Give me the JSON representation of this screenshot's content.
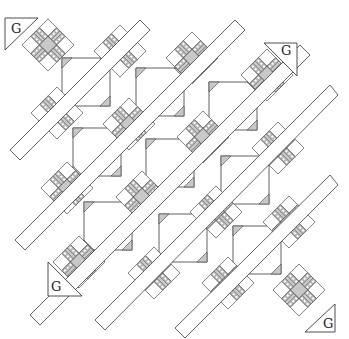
{
  "diagram": {
    "colors": {
      "line": "#3a3a3a",
      "gray": "#c8c8c8",
      "white": "#ffffff",
      "hatch": "#8a8a8a"
    },
    "star_size": 52,
    "snowball_size": 48,
    "stars": [
      [
        48,
        45
      ],
      [
        120,
        51
      ],
      [
        192,
        58
      ],
      [
        267,
        75
      ],
      [
        57,
        113
      ],
      [
        129,
        124
      ],
      [
        203,
        137
      ],
      [
        278,
        148
      ],
      [
        67,
        188
      ],
      [
        142,
        197
      ],
      [
        216,
        212
      ],
      [
        289,
        222
      ],
      [
        79,
        262
      ],
      [
        154,
        273
      ],
      [
        228,
        283
      ],
      [
        299,
        290
      ]
    ],
    "snowballs": [
      [
        86,
        82
      ],
      [
        160,
        92
      ],
      [
        233,
        106
      ],
      [
        97,
        152
      ],
      [
        170,
        163
      ],
      [
        245,
        180
      ],
      [
        108,
        226
      ],
      [
        183,
        238
      ],
      [
        257,
        250
      ]
    ],
    "sashing_strips": [
      [
        [
          10,
          150
        ],
        [
          140,
          20
        ],
        [
          150,
          30
        ],
        [
          20,
          160
        ]
      ],
      [
        [
          15,
          240
        ],
        [
          235,
          20
        ],
        [
          245,
          30
        ],
        [
          25,
          250
        ]
      ],
      [
        [
          30,
          315
        ],
        [
          300,
          45
        ],
        [
          310,
          55
        ],
        [
          40,
          325
        ]
      ],
      [
        [
          95,
          320
        ],
        [
          330,
          85
        ],
        [
          338,
          95
        ],
        [
          105,
          330
        ]
      ],
      [
        [
          175,
          328
        ],
        [
          330,
          175
        ],
        [
          338,
          185
        ],
        [
          185,
          338
        ]
      ]
    ],
    "corner_triangles": [
      {
        "label": "G",
        "points": [
          [
            5,
            18
          ],
          [
            38,
            18
          ],
          [
            5,
            50
          ]
        ],
        "text_pos": [
          11,
          33
        ]
      },
      {
        "label": "G",
        "points": [
          [
            264,
            43
          ],
          [
            297,
            43
          ],
          [
            297,
            76
          ]
        ],
        "text_pos": [
          281,
          55
        ]
      },
      {
        "label": "G",
        "points": [
          [
            48,
            262
          ],
          [
            48,
            296
          ],
          [
            82,
            296
          ]
        ],
        "text_pos": [
          51,
          291
        ]
      },
      {
        "label": "G",
        "points": [
          [
            335,
            304
          ],
          [
            335,
            332
          ],
          [
            305,
            332
          ]
        ],
        "text_pos": [
          323,
          328
        ]
      }
    ]
  }
}
